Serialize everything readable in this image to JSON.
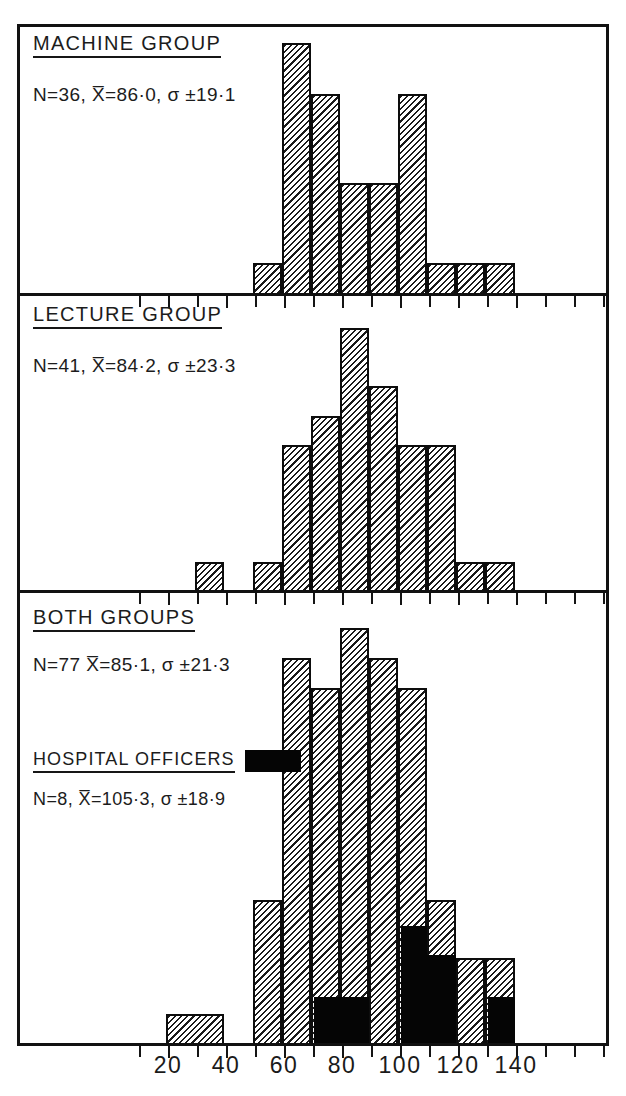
{
  "figure": {
    "kind": "three stacked histograms with shared x axis",
    "background_color": "#ffffff",
    "ink_color": "#111111",
    "hatch_fill_color": "#1a1a1a",
    "solid_fill_color": "#050505"
  },
  "axis": {
    "tick_labels": [
      "20",
      "40",
      "60",
      "80",
      "100",
      "120",
      "140"
    ],
    "tick_values": [
      20,
      40,
      60,
      80,
      100,
      120,
      140
    ],
    "minor_tick_step": 10,
    "xlim": [
      10,
      180
    ]
  },
  "panels": [
    {
      "id": "machine-group",
      "title": "MACHINE GROUP",
      "stats": "N=36, X̅=86·0, σ ±19·1",
      "n": 36,
      "mean": 86.0,
      "sd": 19.1
    },
    {
      "id": "lecture-group",
      "title": "LECTURE GROUP",
      "stats": "N=41, X̅=84·2, σ ±23·3",
      "n": 41,
      "mean": 84.2,
      "sd": 23.3
    },
    {
      "id": "both-groups",
      "title": "BOTH GROUPS",
      "stats": "N=77  X̅=85·1, σ ±21·3",
      "n": 77,
      "mean": 85.1,
      "sd": 21.3,
      "legend_title": "HOSPITAL OFFICERS",
      "legend_stats": "N=8, X̅=105·3, σ ±18·9",
      "legend_n": 8,
      "legend_mean": 105.3,
      "legend_sd": 18.9,
      "legend_swatch_color": "#050505"
    }
  ],
  "chart_data": [
    {
      "type": "bar",
      "id": "machine-group",
      "title": "MACHINE GROUP",
      "xlabel": "",
      "ylabel": "",
      "bin_width": 10,
      "bin_starts": [
        50,
        60,
        70,
        80,
        90,
        100,
        110,
        120,
        130
      ],
      "bin_labels": [
        "50-60",
        "60-70",
        "70-80",
        "80-90",
        "90-100",
        "100-110",
        "110-120",
        "120-130",
        "130-140"
      ],
      "values": [
        1,
        9,
        7,
        3,
        3,
        7,
        1,
        1,
        1
      ],
      "fill": "hatch",
      "ymax": 9
    },
    {
      "type": "bar",
      "id": "lecture-group",
      "title": "LECTURE GROUP",
      "xlabel": "",
      "ylabel": "",
      "bin_width": 10,
      "bin_starts": [
        30,
        50,
        60,
        70,
        80,
        90,
        100,
        110,
        120,
        130
      ],
      "bin_labels": [
        "30-40",
        "50-60",
        "60-70",
        "70-80",
        "80-90",
        "90-100",
        "100-110",
        "110-120",
        "120-130",
        "130-140"
      ],
      "values": [
        1,
        0,
        5,
        6,
        9,
        7,
        5,
        5,
        1,
        1
      ],
      "fill": "hatch",
      "ymax": 9
    },
    {
      "type": "bar",
      "id": "both-groups",
      "title": "BOTH GROUPS",
      "xlabel": "",
      "ylabel": "",
      "bin_width": 10,
      "bin_starts": [
        20,
        50,
        60,
        70,
        80,
        90,
        100,
        110,
        120,
        130
      ],
      "bin_labels": [
        "20-40",
        "50-60",
        "60-70",
        "70-80",
        "80-90",
        "90-100",
        "100-110",
        "110-120",
        "120-130",
        "130-140"
      ],
      "series": [
        {
          "name": "BOTH GROUPS",
          "fill": "hatch",
          "values": [
            1,
            4,
            14,
            12,
            16,
            14,
            12,
            4,
            2,
            1
          ]
        },
        {
          "name": "HOSPITAL OFFICERS",
          "fill": "solid",
          "values": [
            0,
            0,
            0,
            2,
            2,
            0,
            5,
            4,
            0,
            2
          ]
        }
      ],
      "ymax": 16,
      "legend": [
        {
          "label": "HOSPITAL OFFICERS",
          "color": "#050505"
        }
      ],
      "legend_position": "inside-left"
    }
  ]
}
